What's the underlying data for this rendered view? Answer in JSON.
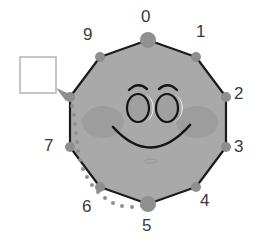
{
  "figure": {
    "title_visible": false,
    "canvas": {
      "width": 265,
      "height": 247,
      "background": "#ffffff"
    }
  },
  "colors": {
    "body_fill": "#a9a9a9",
    "body_stroke": "#1c1c1c",
    "vertex_dot": "#8e8e8e",
    "vertex_dot_large": "#909090",
    "blush": "#9a9a9a",
    "face_stroke": "#141414",
    "eye_fill": "#a0a0a0",
    "eye_highlight": "#ffffff",
    "label_text": "#3a3a3a",
    "path_dots": "#8f8f8f",
    "arrow": "#8f8f8f",
    "square_stroke": "#b8b8b8",
    "square_fill": "#ffffff"
  },
  "polygon": {
    "name": "decagon",
    "sides": 10,
    "center": {
      "x": 148,
      "y": 122
    },
    "radius": 82
  },
  "vertices": [
    {
      "index": 0,
      "label": "0",
      "x": 148,
      "y": 40,
      "dot_r": 8,
      "label_x": 141,
      "label_y": 8,
      "emphasized": true
    },
    {
      "index": 1,
      "label": "1",
      "x": 196,
      "y": 57,
      "dot_r": 5,
      "label_x": 196,
      "label_y": 23,
      "emphasized": false
    },
    {
      "index": 2,
      "label": "2",
      "x": 226,
      "y": 97,
      "dot_r": 5,
      "label_x": 234,
      "label_y": 85,
      "emphasized": false
    },
    {
      "index": 3,
      "label": "3",
      "x": 226,
      "y": 147,
      "dot_r": 5,
      "label_x": 234,
      "label_y": 138,
      "emphasized": false
    },
    {
      "index": 4,
      "label": "4",
      "x": 196,
      "y": 187,
      "dot_r": 5,
      "label_x": 200,
      "label_y": 192,
      "emphasized": false
    },
    {
      "index": 5,
      "label": "5",
      "x": 148,
      "y": 204,
      "dot_r": 8,
      "label_x": 142,
      "label_y": 217,
      "emphasized": true
    },
    {
      "index": 6,
      "label": "6",
      "x": 100,
      "y": 187,
      "dot_r": 5,
      "label_x": 82,
      "label_y": 198,
      "emphasized": false
    },
    {
      "index": 7,
      "label": "7",
      "x": 70,
      "y": 147,
      "dot_r": 5,
      "label_x": 44,
      "label_y": 137,
      "emphasized": false
    },
    {
      "index": 8,
      "label": "",
      "x": 70,
      "y": 97,
      "dot_r": 5,
      "label_x": 0,
      "label_y": 0,
      "emphasized": false
    },
    {
      "index": 9,
      "label": "9",
      "x": 100,
      "y": 57,
      "dot_r": 5,
      "label_x": 83,
      "label_y": 26,
      "emphasized": false
    }
  ],
  "face": {
    "left_eye": {
      "cx": 138,
      "cy": 108,
      "rx": 11,
      "ry": 14
    },
    "right_eye": {
      "cx": 167,
      "cy": 108,
      "rx": 11,
      "ry": 14
    },
    "left_brow": {
      "label": "left-eyebrow"
    },
    "right_brow": {
      "label": "right-eyebrow"
    },
    "mouth": {
      "label": "smile-mouth"
    },
    "left_blush": {
      "cx": 103,
      "cy": 122,
      "rx": 21,
      "ry": 16
    },
    "right_blush": {
      "cx": 197,
      "cy": 122,
      "rx": 21,
      "ry": 16
    },
    "chin_mark": {
      "cx": 151,
      "cy": 161,
      "rx": 6,
      "ry": 2
    }
  },
  "annotation": {
    "target_square": {
      "x": 20,
      "y": 57,
      "size": 36,
      "label": "empty-target-square"
    },
    "arrow": {
      "tip_x": 58,
      "tip_y": 90,
      "label": "path-arrowhead"
    },
    "path": {
      "label": "dotted-traversal-path",
      "from_vertex": 5,
      "to_vertex": 8,
      "dot_radius": 2.0,
      "points": [
        [
          142,
          206
        ],
        [
          132,
          207
        ],
        [
          122,
          206
        ],
        [
          113,
          203
        ],
        [
          105,
          198
        ],
        [
          98,
          192
        ],
        [
          92,
          185
        ],
        [
          87,
          177
        ],
        [
          83,
          169
        ],
        [
          80,
          160
        ],
        [
          78,
          151
        ],
        [
          77,
          142
        ],
        [
          76,
          133
        ],
        [
          75,
          124
        ],
        [
          74,
          115
        ],
        [
          72,
          106
        ],
        [
          68,
          98
        ]
      ]
    }
  }
}
